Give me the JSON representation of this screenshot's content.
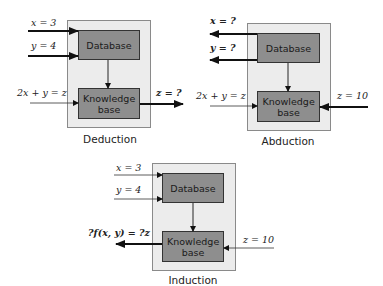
{
  "diagrams": {
    "deduction": {
      "caption": "Deduction",
      "database_label": "Database",
      "knowledge_label": "Knowledge base",
      "inputs": [
        "x = 3",
        "y = 4",
        "2x + y = z"
      ],
      "output": "z = ?"
    },
    "abduction": {
      "caption": "Abduction",
      "database_label": "Database",
      "knowledge_label": "Knowledge base",
      "inputs": [
        "2x + y = z",
        "z = 10"
      ],
      "outputs": [
        "x = ?",
        "y = ?"
      ]
    },
    "induction": {
      "caption": "Induction",
      "database_label": "Database",
      "knowledge_label": "Knowledge base",
      "inputs": [
        "x = 3",
        "y = 4",
        "z = 10"
      ],
      "output": "?f(x, y) = ?z"
    }
  },
  "colors": {
    "panel_fill": "#ececec",
    "box_fill": "#8e8e8e",
    "arrow": "#111111"
  }
}
